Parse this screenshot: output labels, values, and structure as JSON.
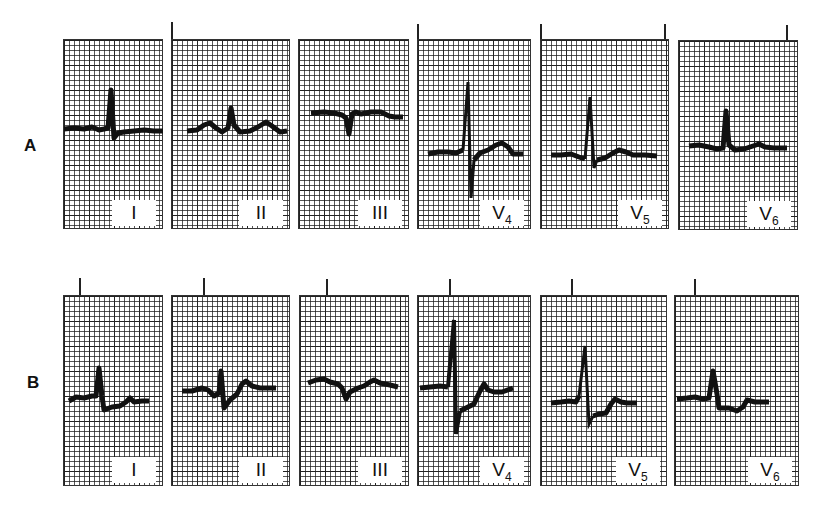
{
  "figure": {
    "rows": [
      {
        "label": "A",
        "panels": [
          {
            "lead": "I",
            "sub": ""
          },
          {
            "lead": "II",
            "sub": ""
          },
          {
            "lead": "III",
            "sub": ""
          },
          {
            "lead": "V",
            "sub": "4"
          },
          {
            "lead": "V",
            "sub": "5"
          },
          {
            "lead": "V",
            "sub": "6"
          }
        ]
      },
      {
        "label": "B",
        "panels": [
          {
            "lead": "I",
            "sub": ""
          },
          {
            "lead": "II",
            "sub": ""
          },
          {
            "lead": "III",
            "sub": ""
          },
          {
            "lead": "V",
            "sub": "4"
          },
          {
            "lead": "V",
            "sub": "5"
          },
          {
            "lead": "V",
            "sub": "6"
          }
        ]
      }
    ],
    "trace_color": "#111111",
    "grid_color": "#222222"
  }
}
